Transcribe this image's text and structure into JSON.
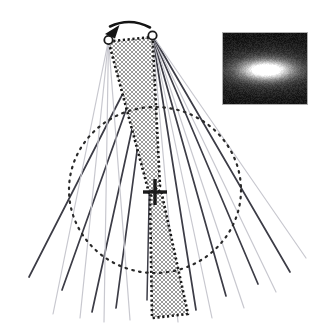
{
  "figure": {
    "kind": "scientific-diagram",
    "caption_text": "",
    "background_color": "#ffffff"
  },
  "colors": {
    "dark_ray": "#3c3c46",
    "light_ray": "#c8c8cf",
    "hatch_fill": "#b4b4b4",
    "hatch_border": "#1a1a1a",
    "dotted_circle": "#2a2a2a",
    "node_stroke": "#1a1a1a",
    "node_fill": "#ffffff",
    "arrow": "#141414",
    "cross": "#1a1a1a",
    "inset_border": "#b0b0b0",
    "inset_background": "#1a1a1a",
    "inset_blob_core": "#ffffff"
  },
  "nodes": [
    {
      "id": "node-left",
      "label": "",
      "cx": 108.5,
      "cy": 40.0,
      "r": 4.2
    },
    {
      "id": "node-right",
      "label": "",
      "cx": 152.5,
      "cy": 35.5,
      "r": 4.2
    }
  ],
  "motion_arrow": {
    "name": "motion-arrow",
    "description": "curved arrow from right node toward left node",
    "start": [
      150.0,
      27.5
    ],
    "control": [
      130.0,
      17.0
    ],
    "end": [
      110.0,
      26.5
    ],
    "head_tip": [
      105.0,
      34.0
    ],
    "stroke_width": 2.6
  },
  "center_marker": {
    "name": "center-cross",
    "cx": 155.0,
    "cy": 192.0,
    "half_width": 12.0,
    "half_height": 13.0,
    "stroke_width": 3.4
  },
  "dotted_circle": {
    "name": "field-circle",
    "cx": 155.0,
    "cy": 190.0,
    "rx": 86.0,
    "ry": 83.0,
    "dash": "1.6 5.4",
    "stroke_width": 2.2
  },
  "hatched_regions": [
    {
      "name": "upper-hatched-wedge",
      "points": "108.5,41.5 152.5,37.0 160.0,186.0 149.0,193.0"
    },
    {
      "name": "lower-hatched-wedge",
      "points": "150.0,196.0 161.0,190.0 188.0,314.0 152.0,318.0"
    }
  ],
  "ray_fan": {
    "name": "ray-fan",
    "description": "fan of alternating dark and light straight rays emanating from the two apex nodes",
    "rays": [
      {
        "origin": "node-right",
        "x2": 29.0,
        "y2": 277.0,
        "shade": "dark",
        "w": 1.7
      },
      {
        "origin": "node-left",
        "x2": 53.0,
        "y2": 314.0,
        "shade": "light",
        "w": 1.2
      },
      {
        "origin": "node-right",
        "x2": 62.0,
        "y2": 290.0,
        "shade": "dark",
        "w": 1.7
      },
      {
        "origin": "node-left",
        "x2": 80.0,
        "y2": 318.0,
        "shade": "light",
        "w": 1.2
      },
      {
        "origin": "node-right",
        "x2": 92.0,
        "y2": 312.0,
        "shade": "dark",
        "w": 1.7
      },
      {
        "origin": "node-left",
        "x2": 104.0,
        "y2": 322.0,
        "shade": "light",
        "w": 1.2
      },
      {
        "origin": "node-right",
        "x2": 116.0,
        "y2": 308.0,
        "shade": "dark",
        "w": 1.7
      },
      {
        "origin": "node-left",
        "x2": 130.0,
        "y2": 320.0,
        "shade": "light",
        "w": 1.2
      },
      {
        "origin": "node-right",
        "x2": 147.0,
        "y2": 300.0,
        "shade": "dark",
        "w": 1.5
      },
      {
        "origin": "node-right",
        "x2": 196.0,
        "y2": 310.0,
        "shade": "dark",
        "w": 1.7
      },
      {
        "origin": "node-right",
        "x2": 212.0,
        "y2": 318.0,
        "shade": "light",
        "w": 1.2
      },
      {
        "origin": "node-right",
        "x2": 226.0,
        "y2": 296.0,
        "shade": "dark",
        "w": 1.7
      },
      {
        "origin": "node-right",
        "x2": 244.0,
        "y2": 308.0,
        "shade": "light",
        "w": 1.2
      },
      {
        "origin": "node-right",
        "x2": 258.0,
        "y2": 284.0,
        "shade": "dark",
        "w": 1.7
      },
      {
        "origin": "node-right",
        "x2": 276.0,
        "y2": 292.0,
        "shade": "light",
        "w": 1.2
      },
      {
        "origin": "node-right",
        "x2": 290.0,
        "y2": 272.0,
        "shade": "dark",
        "w": 1.7
      },
      {
        "origin": "node-right",
        "x2": 306.0,
        "y2": 258.0,
        "shade": "light",
        "w": 1.2
      },
      {
        "origin": "node-right",
        "x2": 178.0,
        "y2": 322.0,
        "shade": "light",
        "w": 1.2
      }
    ]
  },
  "inset_image": {
    "name": "astronomical-inset",
    "alt_text": "noisy dark field with bright elongated elliptical source",
    "x": 222,
    "y": 32,
    "width": 86,
    "height": 73,
    "border_width": 1,
    "blob": {
      "cx": 0.5,
      "cy": 0.5,
      "rx": 0.3,
      "ry": 0.135,
      "noise_amplitude": 26
    }
  }
}
